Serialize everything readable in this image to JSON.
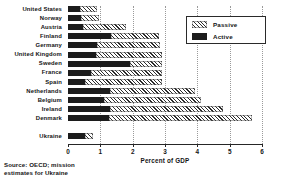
{
  "chart_data": {
    "type": "bar",
    "orientation": "horizontal",
    "stacked": true,
    "title": "",
    "xlabel": "Percent of GDP",
    "ylabel": "",
    "xlim": [
      0,
      6
    ],
    "xticks": [
      0,
      1,
      2,
      3,
      4,
      5,
      6
    ],
    "xtick_labels": [
      "0",
      "1",
      "2",
      "3",
      "4",
      "5",
      "6"
    ],
    "grid": true,
    "grid_axis": "x",
    "legend_position": "upper right",
    "categories": [
      "United States",
      "Norway",
      "Austria",
      "Finland",
      "Germany",
      "United Kingdom",
      "Sweden",
      "France",
      "Spain",
      "Netherlands",
      "Belgium",
      "Ireland",
      "Denmark",
      "Ukraine"
    ],
    "series": [
      {
        "name": "Active",
        "fill": "solid-black",
        "color": "#1c1c1c",
        "values": [
          0.37,
          0.4,
          0.46,
          1.32,
          0.9,
          0.88,
          1.92,
          0.72,
          0.54,
          1.3,
          1.12,
          1.3,
          1.27,
          0.54
        ]
      },
      {
        "name": "Passive",
        "fill": "hatched",
        "color": "#2a2a2a",
        "values": [
          0.53,
          0.56,
          1.34,
          1.48,
          1.94,
          2.02,
          0.98,
          2.18,
          2.36,
          2.62,
          2.98,
          3.5,
          4.43,
          0.22
        ]
      }
    ],
    "totals": [
      0.9,
      0.96,
      1.8,
      2.8,
      2.84,
      2.9,
      2.9,
      2.9,
      2.9,
      3.92,
      4.1,
      4.8,
      5.7,
      0.76
    ],
    "gap_before_last_category": true,
    "annotations": [
      "Source: OECD; mission estimates for Ukraine"
    ]
  },
  "legend": {
    "items": [
      {
        "label": "Passive",
        "swatch": "hatched"
      },
      {
        "label": "Active",
        "swatch": "solid"
      }
    ]
  },
  "source": {
    "line1": "Source:  OECD; mission",
    "line2": "estimates for Ukraine"
  }
}
